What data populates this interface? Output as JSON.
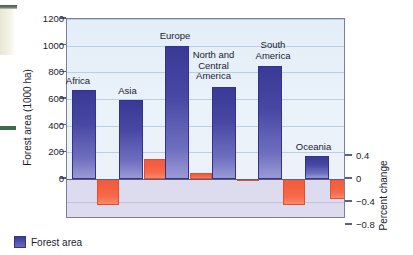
{
  "chart_data": {
    "type": "bar",
    "title": "",
    "categories": [
      "Africa",
      "Asia",
      "Europe",
      "North and\nCentral\nAmerica",
      "South\nAmerica",
      "Oceania"
    ],
    "series": [
      {
        "name": "Forest area",
        "axis": "left",
        "unit": "1000 ha",
        "color": "#3a3a96",
        "values": [
          665,
          595,
          995,
          690,
          845,
          172
        ]
      },
      {
        "name": "Percent change",
        "axis": "right",
        "unit": "percent",
        "color": "#f4593f",
        "values": [
          -0.45,
          0.35,
          0.1,
          -0.02,
          -0.45,
          -0.35
        ]
      }
    ],
    "ylabel": "Forest area (1000 ha)",
    "ylabel_right": "Percent change",
    "xlabel": "",
    "ylim": [
      0,
      1200
    ],
    "ylim_right": [
      -0.8,
      0.6
    ],
    "yticks": [
      0,
      200,
      400,
      600,
      800,
      1000,
      1200
    ],
    "yticks_right": [
      0.4,
      0,
      -0.4,
      -0.8
    ],
    "ytick_labels": [
      "0",
      "200",
      "400",
      "600",
      "800",
      "1000",
      "1200"
    ],
    "ytick_labels_right": [
      "0.4",
      "0",
      "−0.4",
      "−0.8"
    ],
    "grid": true,
    "legend": [
      {
        "label": "Forest area",
        "color": "#3a3a96"
      }
    ],
    "legend_position": "bottom-left"
  },
  "axes": {
    "left_title": "Forest area (1000 ha)",
    "right_title": "Percent change"
  },
  "legend": {
    "forest_area_label": "Forest area"
  }
}
